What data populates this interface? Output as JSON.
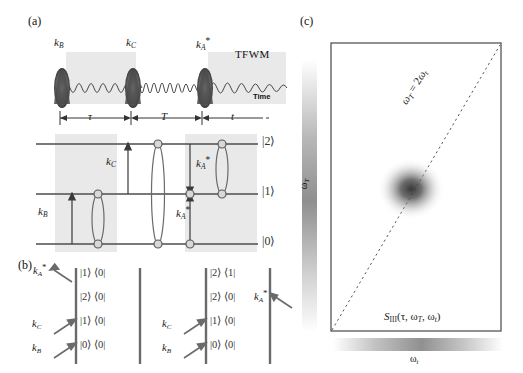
{
  "figure": {
    "panels": [
      "(a)",
      "(b)",
      "(c)"
    ]
  },
  "panel_a": {
    "label": "(a)",
    "pulses": [
      {
        "name": "pulse-kB",
        "label_base": "k",
        "label_sub": "B",
        "label_star": "",
        "x": 62
      },
      {
        "name": "pulse-kC",
        "label_base": "k",
        "label_sub": "C",
        "label_star": "",
        "x": 133
      },
      {
        "name": "pulse-kA",
        "label_base": "k",
        "label_sub": "A",
        "label_star": "*",
        "x": 205
      }
    ],
    "signal_label": "TFWM",
    "time_axis_label": "Time",
    "delays": [
      {
        "name": "delay-tau",
        "symbol": "τ"
      },
      {
        "name": "delay-T",
        "symbol": "T"
      },
      {
        "name": "delay-t",
        "symbol": "t"
      }
    ],
    "levels": [
      {
        "name": "level-2",
        "ket": "|2⟩"
      },
      {
        "name": "level-1",
        "ket": "|1⟩"
      },
      {
        "name": "level-0",
        "ket": "|0⟩"
      }
    ],
    "transitions": [
      {
        "name": "arrow-kB",
        "base": "k",
        "sub": "B",
        "star": ""
      },
      {
        "name": "arrow-kC",
        "base": "k",
        "sub": "C",
        "star": ""
      },
      {
        "name": "arrow-kA-upper",
        "base": "k",
        "sub": "A",
        "star": "*"
      },
      {
        "name": "arrow-kA-lower",
        "base": "k",
        "sub": "A",
        "star": "*"
      }
    ]
  },
  "panel_b": {
    "label": "(b)",
    "diagrams": [
      {
        "name": "feynman-diagram-left",
        "states": [
          "|0⟩ ⟨0|",
          "|1⟩ ⟨0|",
          "|2⟩ ⟨0|",
          "|1⟩ ⟨0|"
        ],
        "interactions": [
          {
            "name": "interaction-kB",
            "base": "k",
            "sub": "B",
            "star": "",
            "dir": "in-left"
          },
          {
            "name": "interaction-kC",
            "base": "k",
            "sub": "C",
            "star": "",
            "dir": "in-left"
          },
          {
            "name": "interaction-kA",
            "base": "k",
            "sub": "A",
            "star": "*",
            "dir": "out-left"
          }
        ]
      },
      {
        "name": "feynman-diagram-right",
        "states": [
          "|0⟩ ⟨0|",
          "|1⟩ ⟨0|",
          "|2⟩ ⟨0|",
          "|2⟩ ⟨1|"
        ],
        "interactions": [
          {
            "name": "interaction-kB",
            "base": "k",
            "sub": "B",
            "star": "",
            "dir": "in-left"
          },
          {
            "name": "interaction-kC",
            "base": "k",
            "sub": "C",
            "star": "",
            "dir": "in-left"
          },
          {
            "name": "interaction-kA",
            "base": "k",
            "sub": "A",
            "star": "*",
            "dir": "in-right"
          }
        ]
      }
    ]
  },
  "panel_c": {
    "label": "(c)",
    "x_axis_label": "ω",
    "x_axis_sub": "t",
    "y_axis_label": "ω",
    "y_axis_sub": "T",
    "diagonal_label": "ω_T = 2ω_t",
    "diagonal_parts": {
      "lhs_base": "ω",
      "lhs_sub": "T",
      "eq": " = 2",
      "rhs_base": "ω",
      "rhs_sub": "t"
    },
    "signal_function": "S",
    "signal_sub": "III",
    "signal_args": "(τ, ω",
    "signal_args_sub1": "T",
    "signal_args_mid": ", ω",
    "signal_args_sub2": "t",
    "signal_args_end": ")",
    "peak": {
      "name": "spectral-peak",
      "x_frac": 0.47,
      "y_frac": 0.5
    }
  },
  "colors": {
    "ink": "#222222",
    "line": "#555555",
    "shade": "#e9e9e9",
    "peak": "#3a3a3a"
  }
}
